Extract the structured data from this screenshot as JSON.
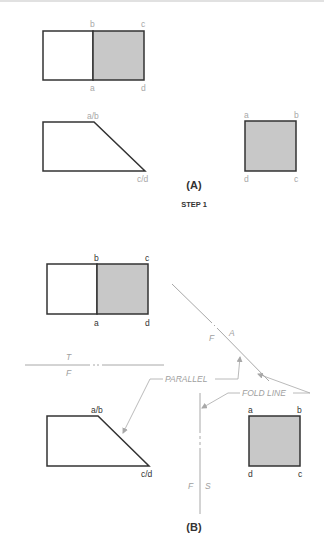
{
  "diagram": {
    "part_a": {
      "caption": "(A)",
      "step_label": "STEP 1",
      "top_view": {
        "labels": {
          "b": "b",
          "c": "c",
          "a": "a",
          "d": "d"
        }
      },
      "front_view": {
        "labels": {
          "ab": "a/b",
          "cd": "c/d"
        }
      },
      "side_view": {
        "labels": {
          "a": "a",
          "b": "b",
          "d": "d",
          "c": "c"
        }
      }
    },
    "part_b": {
      "caption": "(B)",
      "top_view": {
        "labels": {
          "b": "b",
          "c": "c",
          "a": "a",
          "d": "d"
        }
      },
      "front_view": {
        "labels": {
          "ab": "a/b",
          "cd": "c/d"
        }
      },
      "side_view": {
        "labels": {
          "a": "a",
          "b": "b",
          "d": "d",
          "c": "c"
        }
      },
      "fold_lines": {
        "top_front": {
          "upper": "T",
          "lower": "F"
        },
        "front_aux": {
          "left": "F",
          "right": "A"
        },
        "front_side": {
          "left": "F",
          "right": "S"
        }
      },
      "annotations": {
        "parallel": "PARALLEL",
        "fold_line": "FOLD LINE"
      }
    },
    "colors": {
      "outline": "#333333",
      "shading": "#c8c8c8",
      "construction": "#a8a8a8"
    }
  }
}
